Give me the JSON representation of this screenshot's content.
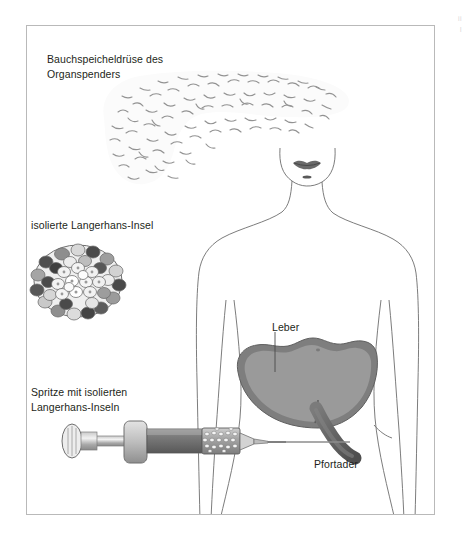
{
  "figure": {
    "title_alt": "Islet cell transplantation diagram",
    "frame": {
      "border_color": "#b9b9b9",
      "background": "#ffffff"
    }
  },
  "labels": {
    "pancreas": "Bauchspeicheldrüse des\nOrganspenders",
    "islet": "isolierte Langerhans-Insel",
    "syringe": "Spritze mit isolierten\nLangerhans-Inseln",
    "liver": "Leber",
    "portal_vein": "Pfortader"
  },
  "edge_fragments": {
    "line1": "ii",
    "line2": "I"
  },
  "colors": {
    "text": "#231f20",
    "frame_border": "#b9b9b9",
    "body_outline": "#6d6d6d",
    "liver_fill": "#9a9a9a",
    "liver_rim": "#7e7e7e",
    "portal_vein": "#6f6f6f",
    "portal_vein_shade": "#565656",
    "syringe_barrel": "#8c8c8c",
    "syringe_light": "#d8d8d8",
    "syringe_dark": "#6a6a6a",
    "islet_dark_cell": "#4a4a4a",
    "islet_mid_cell": "#9e9e9e",
    "islet_light_cell": "#efefef",
    "pancreas_stipple": "#8d8d8d",
    "lips": "#6a6a6a"
  },
  "structures": [
    {
      "name": "donor-pancreas",
      "label_key": "pancreas"
    },
    {
      "name": "isolated-islet",
      "label_key": "islet"
    },
    {
      "name": "syringe-with-islets",
      "label_key": "syringe"
    },
    {
      "name": "liver",
      "label_key": "liver"
    },
    {
      "name": "portal-vein",
      "label_key": "portal_vein"
    },
    {
      "name": "human-torso",
      "label_key": null
    }
  ]
}
